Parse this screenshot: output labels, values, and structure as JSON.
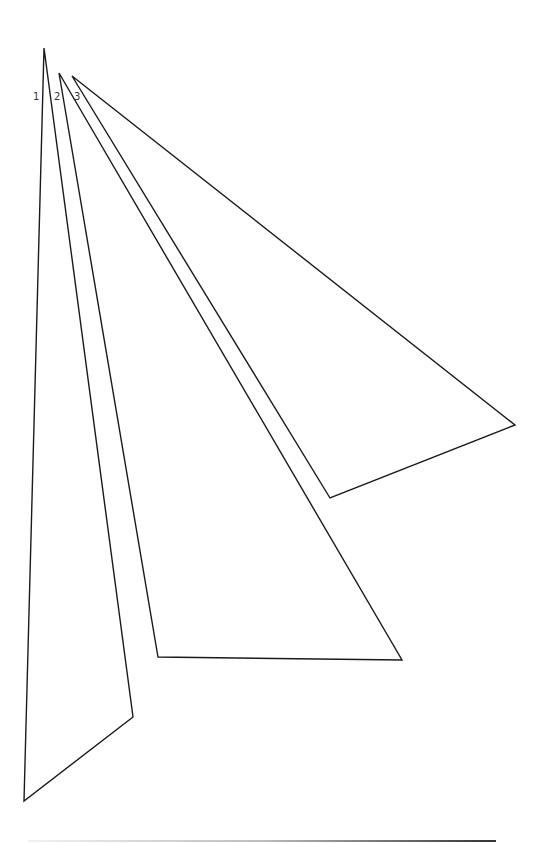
{
  "diagram": {
    "triangles": [
      {
        "label": "1",
        "points": "44,48 133,717 24,801",
        "label_pos": [
          33,
          100
        ]
      },
      {
        "label": "2",
        "points": "59,73 402,660 158,657",
        "label_pos": [
          54,
          100
        ]
      },
      {
        "label": "3",
        "points": "72,76 515,425 330,498",
        "label_pos": [
          74,
          100
        ]
      }
    ],
    "colors": {
      "stroke": "#1a1a1a",
      "background": "#ffffff"
    },
    "bottom_line": {
      "x1": 28,
      "x2": 496,
      "y": 841
    }
  }
}
